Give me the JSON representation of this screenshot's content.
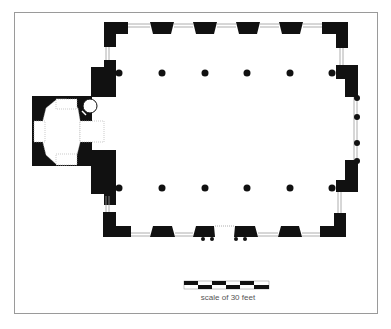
{
  "diagram": {
    "type": "architectural-floor-plan",
    "colors": {
      "wall": "#111111",
      "background": "#ffffff",
      "frame": "#9a9a9a",
      "window_line": "#999999"
    },
    "scale": {
      "label": "scale of 30 feet",
      "segments": 6
    },
    "nave": {
      "columns_per_row": 6,
      "rows": 2
    },
    "annex": {
      "shape": "octagonal",
      "side": "west"
    }
  }
}
